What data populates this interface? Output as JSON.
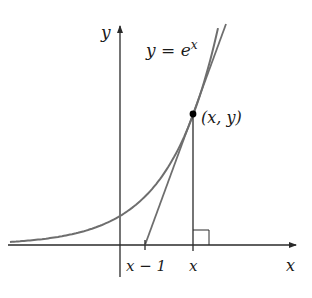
{
  "diagram": {
    "curve_label": {
      "base": "y = e",
      "exponent": "x"
    },
    "point_label": "(x, y)",
    "axes": {
      "y_label": "y",
      "x_label": "x"
    },
    "ticks": {
      "x_minus_one": "x − 1",
      "x": "x"
    },
    "colors": {
      "curve": "#6e6e6e",
      "tangent": "#6e6e6e",
      "axes": "#2a2a2a",
      "point": "#000000"
    },
    "elements": [
      "exponential curve y = e^x",
      "tangent line at (x, y) meeting x-axis at x − 1",
      "vertical segment from (x, y) to x-axis",
      "right-angle marker at foot of vertical segment"
    ]
  }
}
